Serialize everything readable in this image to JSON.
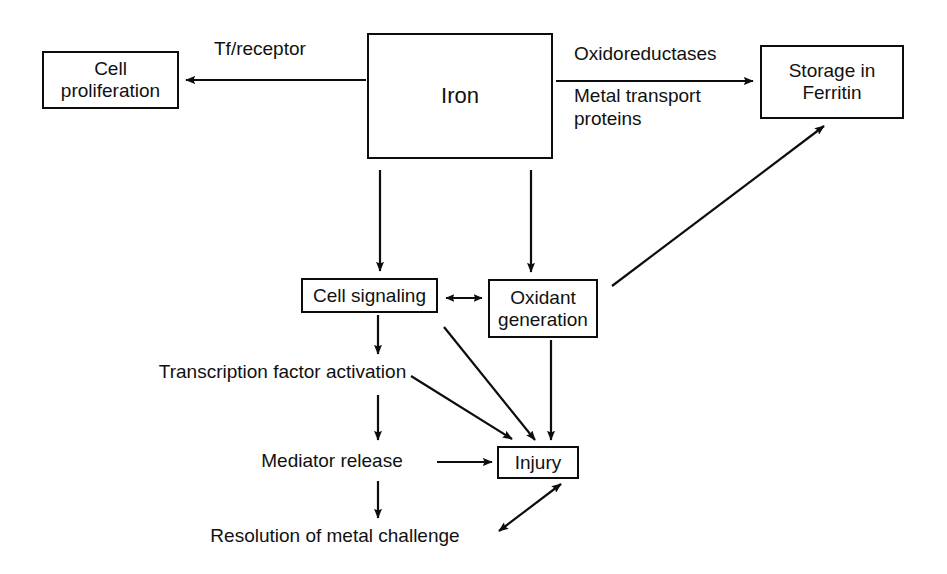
{
  "diagram": {
    "stroke_color": "#0d0d0d",
    "background_color": "#ffffff",
    "nodes": {
      "cell_proliferation": "Cell\nproliferation",
      "iron": "Iron",
      "storage_ferritin": "Storage in\nFerritin",
      "cell_signaling": "Cell signaling",
      "oxidant_generation": "Oxidant\ngeneration",
      "injury": "Injury",
      "transcription_factor_activation": "Transcription factor activation",
      "mediator_release": "Mediator release",
      "resolution_metal_challenge": "Resolution of metal challenge"
    },
    "edge_labels": {
      "tf_receptor": "Tf/receptor",
      "oxidoreductases": "Oxidoreductases",
      "metal_transport_proteins": "Metal transport\nproteins"
    },
    "edges": [
      {
        "from": "iron",
        "to": "cell_proliferation",
        "label": "Tf/receptor",
        "arrow": "single"
      },
      {
        "from": "iron",
        "to": "storage_ferritin",
        "label": "Oxidoreductases / Metal transport proteins",
        "arrow": "single"
      },
      {
        "from": "iron",
        "to": "cell_signaling",
        "label": "",
        "arrow": "single"
      },
      {
        "from": "iron",
        "to": "oxidant_generation",
        "label": "",
        "arrow": "single"
      },
      {
        "from": "cell_signaling",
        "to": "oxidant_generation",
        "label": "",
        "arrow": "double"
      },
      {
        "from": "oxidant_generation",
        "to": "storage_ferritin",
        "label": "",
        "arrow": "single"
      },
      {
        "from": "cell_signaling",
        "to": "transcription_factor_activation",
        "label": "",
        "arrow": "single"
      },
      {
        "from": "cell_signaling",
        "to": "injury",
        "label": "",
        "arrow": "single"
      },
      {
        "from": "oxidant_generation",
        "to": "injury",
        "label": "",
        "arrow": "single"
      },
      {
        "from": "transcription_factor_activation",
        "to": "injury",
        "label": "",
        "arrow": "single"
      },
      {
        "from": "transcription_factor_activation",
        "to": "mediator_release",
        "label": "",
        "arrow": "single"
      },
      {
        "from": "mediator_release",
        "to": "injury",
        "label": "",
        "arrow": "single"
      },
      {
        "from": "mediator_release",
        "to": "resolution_metal_challenge",
        "label": "",
        "arrow": "single"
      },
      {
        "from": "resolution_metal_challenge",
        "to": "injury",
        "label": "",
        "arrow": "double"
      }
    ]
  }
}
